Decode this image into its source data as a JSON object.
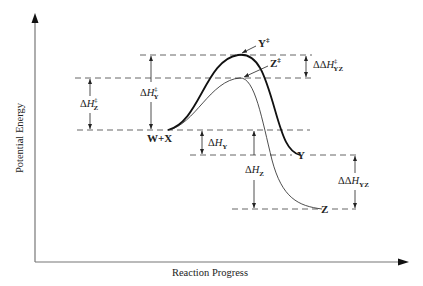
{
  "diagram": {
    "type": "reaction-energy-profile",
    "axes": {
      "y_label": "Potential Energy",
      "x_label": "Reaction Progress"
    },
    "species": {
      "reactants": "W+X",
      "product_y": "Y",
      "product_z": "Z",
      "ts_y": "Y",
      "ts_z": "Z",
      "double_dagger": "‡"
    },
    "annotations": {
      "delta": "Δ",
      "delta_delta": "ΔΔ",
      "H": "H",
      "dH_ts_z_sub": "Z",
      "dH_ts_y_sub": "Y",
      "dH_y_sub": "Y",
      "dH_z_sub": "Z",
      "ddH_ts_sub": "YZ",
      "ddH_sub": "YZ"
    },
    "colors": {
      "line": "#1a1a1a",
      "dash": "#555555",
      "axis": "#666666"
    }
  }
}
